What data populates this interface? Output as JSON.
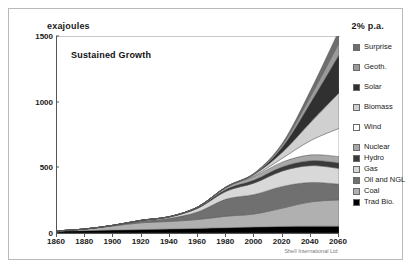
{
  "figure": {
    "units_label": "exajoules",
    "growth_rate_label": "2% p.a.",
    "scenario_title": "Sustained Growth",
    "credit": "Shell International Ltd"
  },
  "chart_data": {
    "type": "area",
    "title": "Sustained Growth",
    "subtitle": "2% p.a.",
    "xlabel": "",
    "ylabel": "exajoules",
    "ylim": [
      0,
      1500
    ],
    "xlim": [
      1860,
      2060
    ],
    "grid": false,
    "legend_position": "right",
    "stacked": true,
    "stack_order_bottom_to_top": [
      "Trad Bio.",
      "Coal",
      "Oil and NGL",
      "Gas",
      "Hydro",
      "Nuclear",
      "Wind",
      "Biomass",
      "Solar",
      "Geoth.",
      "Surprise"
    ],
    "yticks": [
      0,
      500,
      1000,
      1500
    ],
    "xticks": [
      1860,
      1880,
      1900,
      1920,
      1940,
      1960,
      1980,
      2000,
      2020,
      2040,
      2060
    ],
    "x": [
      1860,
      1880,
      1900,
      1920,
      1940,
      1960,
      1980,
      2000,
      2020,
      2040,
      2060
    ],
    "series": [
      {
        "name": "Trad Bio.",
        "color": "#000000",
        "values": [
          14,
          18,
          22,
          26,
          30,
          35,
          40,
          45,
          50,
          52,
          52
        ]
      },
      {
        "name": "Coal",
        "color": "#b0b0b0",
        "values": [
          2,
          12,
          32,
          52,
          58,
          68,
          88,
          100,
          140,
          185,
          200
        ]
      },
      {
        "name": "Oil and NGL",
        "color": "#707070",
        "values": [
          0,
          1,
          4,
          14,
          24,
          58,
          130,
          148,
          165,
          148,
          120
        ]
      },
      {
        "name": "Gas",
        "color": "#d8d8d8",
        "values": [
          0,
          0,
          1,
          4,
          10,
          28,
          60,
          88,
          118,
          128,
          120
        ]
      },
      {
        "name": "Hydro",
        "color": "#3a3a3a",
        "values": [
          0,
          0,
          0,
          1,
          3,
          8,
          16,
          24,
          32,
          38,
          42
        ]
      },
      {
        "name": "Nuclear",
        "color": "#a8a8a8",
        "values": [
          0,
          0,
          0,
          0,
          0,
          2,
          14,
          26,
          36,
          44,
          48
        ]
      },
      {
        "name": "Wind",
        "color": "#ffffff",
        "values": [
          0,
          0,
          0,
          0,
          0,
          0,
          1,
          6,
          30,
          110,
          215
        ]
      },
      {
        "name": "Biomass",
        "color": "#d0d0d0",
        "values": [
          0,
          0,
          0,
          0,
          0,
          0,
          2,
          10,
          46,
          140,
          270
        ]
      },
      {
        "name": "Solar",
        "color": "#303030",
        "values": [
          0,
          0,
          0,
          0,
          0,
          0,
          0,
          4,
          40,
          150,
          290
        ]
      },
      {
        "name": "Geoth.",
        "color": "#9a9a9a",
        "values": [
          0,
          0,
          0,
          0,
          0,
          0,
          1,
          4,
          18,
          50,
          90
        ]
      },
      {
        "name": "Surprise",
        "color": "#6e6e6e",
        "values": [
          0,
          0,
          0,
          0,
          0,
          0,
          0,
          2,
          12,
          45,
          95
        ]
      }
    ],
    "legend_entries": [
      {
        "label": "Surprise",
        "color": "#6e6e6e"
      },
      {
        "label": "Geoth.",
        "color": "#9a9a9a"
      },
      {
        "label": "Solar",
        "color": "#303030"
      },
      {
        "label": "Biomass",
        "color": "#d0d0d0"
      },
      {
        "label": "Wind",
        "color": "#ffffff"
      },
      {
        "label": "Nuclear",
        "color": "#a8a8a8"
      },
      {
        "label": "Hydro",
        "color": "#3a3a3a"
      },
      {
        "label": "Gas",
        "color": "#d8d8d8"
      },
      {
        "label": "Oil and NGL",
        "color": "#707070"
      },
      {
        "label": "Coal",
        "color": "#b0b0b0"
      },
      {
        "label": "Trad Bio.",
        "color": "#000000"
      }
    ]
  }
}
